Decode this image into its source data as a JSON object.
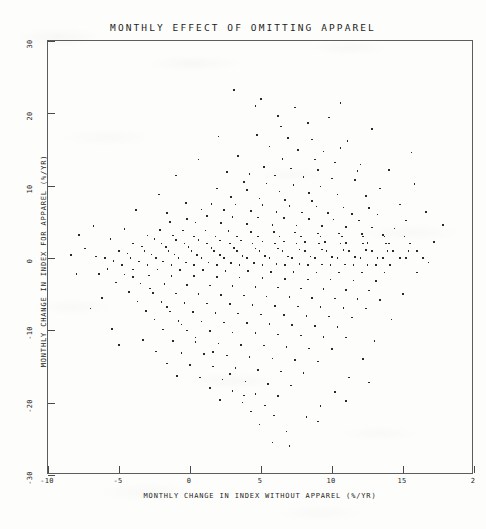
{
  "chart_data": {
    "type": "scatter",
    "title": "MONTHLY EFFECT OF OMITTING APPAREL",
    "xlabel": "MONTHLY CHANGE IN INDEX WITHOUT APPAREL (%/YR)",
    "ylabel": "MONTHLY CHANGE IN INDEX FOR APPAREL (%/YR)",
    "xlim": [
      -10,
      20
    ],
    "ylim": [
      -30,
      30
    ],
    "xticks": [
      -10,
      -5,
      0,
      5,
      10,
      15,
      20
    ],
    "xticklabels": [
      "-10",
      "-5",
      "0",
      "5",
      "10",
      "15",
      "2"
    ],
    "yticks": [
      30,
      20,
      10,
      0,
      -10,
      -20,
      -30
    ],
    "yticklabels": [
      "30",
      "20",
      "10",
      "0",
      "-10",
      "-20",
      "-30"
    ],
    "grid": false,
    "legend": null,
    "marker": "square-dot",
    "marker_color": "#2a2a2a",
    "n_points": 352,
    "points": [
      [
        3.1,
        23.2
      ],
      [
        5.0,
        22.0
      ],
      [
        10.6,
        21.4
      ],
      [
        6.2,
        19.6
      ],
      [
        8.3,
        18.7
      ],
      [
        4.7,
        17.0
      ],
      [
        6.9,
        16.6
      ],
      [
        11.1,
        16.2
      ],
      [
        15.6,
        14.6
      ],
      [
        5.6,
        15.4
      ],
      [
        7.6,
        14.9
      ],
      [
        9.4,
        14.7
      ],
      [
        3.4,
        14.1
      ],
      [
        6.5,
        13.7
      ],
      [
        8.8,
        13.6
      ],
      [
        10.2,
        13.2
      ],
      [
        12.0,
        12.9
      ],
      [
        5.2,
        12.6
      ],
      [
        7.1,
        12.4
      ],
      [
        9.0,
        12.2
      ],
      [
        2.6,
        11.9
      ],
      [
        4.2,
        11.6
      ],
      [
        6.0,
        11.4
      ],
      [
        8.0,
        11.2
      ],
      [
        10.0,
        11.0
      ],
      [
        11.6,
        10.8
      ],
      [
        3.8,
        10.5
      ],
      [
        5.4,
        10.3
      ],
      [
        7.3,
        10.1
      ],
      [
        9.2,
        9.9
      ],
      [
        1.9,
        9.6
      ],
      [
        4.0,
        9.4
      ],
      [
        6.3,
        9.2
      ],
      [
        8.4,
        9.0
      ],
      [
        10.4,
        8.8
      ],
      [
        12.4,
        8.6
      ],
      [
        2.9,
        8.4
      ],
      [
        4.9,
        8.2
      ],
      [
        6.7,
        8.0
      ],
      [
        8.6,
        7.9
      ],
      [
        -0.3,
        7.6
      ],
      [
        1.5,
        7.5
      ],
      [
        3.2,
        7.4
      ],
      [
        5.1,
        7.3
      ],
      [
        7.0,
        7.2
      ],
      [
        8.9,
        7.1
      ],
      [
        10.8,
        7.0
      ],
      [
        12.6,
        6.9
      ],
      [
        0.8,
        6.7
      ],
      [
        2.4,
        6.6
      ],
      [
        4.3,
        6.5
      ],
      [
        6.1,
        6.4
      ],
      [
        7.9,
        6.3
      ],
      [
        9.7,
        6.2
      ],
      [
        11.4,
        6.1
      ],
      [
        13.2,
        6.0
      ],
      [
        1.2,
        5.8
      ],
      [
        3.0,
        5.7
      ],
      [
        4.8,
        5.6
      ],
      [
        6.6,
        5.5
      ],
      [
        8.4,
        5.4
      ],
      [
        10.1,
        5.3
      ],
      [
        11.9,
        5.2
      ],
      [
        -1.4,
        5.0
      ],
      [
        0.4,
        4.9
      ],
      [
        2.2,
        4.8
      ],
      [
        4.0,
        4.7
      ],
      [
        5.8,
        4.6
      ],
      [
        7.5,
        4.5
      ],
      [
        9.3,
        4.4
      ],
      [
        11.0,
        4.3
      ],
      [
        12.8,
        4.2
      ],
      [
        14.4,
        4.1
      ],
      [
        -2.1,
        3.9
      ],
      [
        -0.5,
        3.8
      ],
      [
        1.1,
        3.8
      ],
      [
        2.7,
        3.7
      ],
      [
        4.3,
        3.6
      ],
      [
        5.9,
        3.6
      ],
      [
        7.4,
        3.5
      ],
      [
        9.0,
        3.4
      ],
      [
        10.5,
        3.4
      ],
      [
        12.1,
        3.3
      ],
      [
        13.6,
        3.2
      ],
      [
        -3.0,
        3.1
      ],
      [
        -1.2,
        3.1
      ],
      [
        0.3,
        3.0
      ],
      [
        1.8,
        3.0
      ],
      [
        3.3,
        3.0
      ],
      [
        4.8,
        3.0
      ],
      [
        6.3,
        3.0
      ],
      [
        7.8,
        3.0
      ],
      [
        9.2,
        3.0
      ],
      [
        10.7,
        3.0
      ],
      [
        12.2,
        3.0
      ],
      [
        13.7,
        3.0
      ],
      [
        15.1,
        3.0
      ],
      [
        -2.5,
        2.6
      ],
      [
        -1.0,
        2.5
      ],
      [
        0.6,
        2.5
      ],
      [
        2.1,
        2.4
      ],
      [
        3.6,
        2.4
      ],
      [
        5.1,
        2.3
      ],
      [
        6.6,
        2.3
      ],
      [
        8.1,
        2.2
      ],
      [
        9.5,
        2.2
      ],
      [
        11.0,
        2.1
      ],
      [
        12.5,
        2.1
      ],
      [
        14.0,
        2.0
      ],
      [
        15.5,
        2.0
      ],
      [
        -4.0,
        2.0
      ],
      [
        -2.0,
        2.0
      ],
      [
        -0.4,
        2.0
      ],
      [
        1.2,
        2.0
      ],
      [
        2.8,
        2.0
      ],
      [
        4.4,
        2.0
      ],
      [
        6.0,
        2.0
      ],
      [
        7.5,
        2.0
      ],
      [
        9.1,
        2.0
      ],
      [
        10.6,
        2.0
      ],
      [
        12.2,
        2.0
      ],
      [
        13.8,
        2.0
      ],
      [
        -3.4,
        1.6
      ],
      [
        -1.7,
        1.5
      ],
      [
        -0.1,
        1.5
      ],
      [
        1.5,
        1.4
      ],
      [
        3.1,
        1.4
      ],
      [
        4.6,
        1.3
      ],
      [
        6.2,
        1.3
      ],
      [
        7.7,
        1.2
      ],
      [
        9.3,
        1.2
      ],
      [
        10.8,
        1.1
      ],
      [
        12.4,
        1.1
      ],
      [
        13.9,
        1.0
      ],
      [
        15.4,
        1.0
      ],
      [
        -5.0,
        1.0
      ],
      [
        -3.2,
        1.0
      ],
      [
        -1.5,
        1.0
      ],
      [
        0.1,
        1.0
      ],
      [
        1.7,
        1.0
      ],
      [
        3.3,
        1.0
      ],
      [
        4.9,
        1.0
      ],
      [
        6.5,
        1.0
      ],
      [
        8.1,
        1.0
      ],
      [
        9.6,
        1.0
      ],
      [
        11.2,
        1.0
      ],
      [
        12.8,
        1.0
      ],
      [
        14.3,
        1.0
      ],
      [
        16.0,
        1.0
      ],
      [
        -4.4,
        0.6
      ],
      [
        -2.7,
        0.5
      ],
      [
        -1.1,
        0.5
      ],
      [
        0.5,
        0.4
      ],
      [
        2.1,
        0.4
      ],
      [
        3.7,
        0.3
      ],
      [
        5.3,
        0.3
      ],
      [
        6.9,
        0.2
      ],
      [
        8.5,
        0.2
      ],
      [
        10.0,
        0.1
      ],
      [
        11.6,
        0.1
      ],
      [
        13.2,
        0.0
      ],
      [
        14.8,
        0.0
      ],
      [
        16.4,
        0.0
      ],
      [
        -6.0,
        0.0
      ],
      [
        -4.2,
        0.0
      ],
      [
        -2.4,
        0.0
      ],
      [
        -0.8,
        0.0
      ],
      [
        0.8,
        0.0
      ],
      [
        2.4,
        0.0
      ],
      [
        4.0,
        0.0
      ],
      [
        5.6,
        0.0
      ],
      [
        7.2,
        0.0
      ],
      [
        8.8,
        0.0
      ],
      [
        10.4,
        0.0
      ],
      [
        12.0,
        0.0
      ],
      [
        13.6,
        0.0
      ],
      [
        15.2,
        0.0
      ],
      [
        -5.4,
        -0.4
      ],
      [
        -3.6,
        -0.5
      ],
      [
        -1.9,
        -0.5
      ],
      [
        -0.3,
        -0.6
      ],
      [
        1.3,
        -0.6
      ],
      [
        2.9,
        -0.7
      ],
      [
        4.5,
        -0.7
      ],
      [
        6.1,
        -0.8
      ],
      [
        7.7,
        -0.8
      ],
      [
        9.3,
        -0.9
      ],
      [
        10.9,
        -0.9
      ],
      [
        12.5,
        -1.0
      ],
      [
        14.1,
        -1.0
      ],
      [
        -4.8,
        -1.0
      ],
      [
        -3.0,
        -1.0
      ],
      [
        -1.3,
        -1.0
      ],
      [
        0.3,
        -1.0
      ],
      [
        1.9,
        -1.0
      ],
      [
        3.5,
        -1.0
      ],
      [
        5.1,
        -1.0
      ],
      [
        6.7,
        -1.0
      ],
      [
        8.3,
        -1.0
      ],
      [
        9.9,
        -1.0
      ],
      [
        11.5,
        -1.0
      ],
      [
        13.1,
        -1.0
      ],
      [
        -5.8,
        -1.5
      ],
      [
        -4.0,
        -1.6
      ],
      [
        -2.3,
        -1.6
      ],
      [
        -0.7,
        -1.7
      ],
      [
        0.9,
        -1.7
      ],
      [
        2.5,
        -1.8
      ],
      [
        4.1,
        -1.8
      ],
      [
        5.7,
        -1.9
      ],
      [
        7.3,
        -1.9
      ],
      [
        8.9,
        -2.0
      ],
      [
        10.5,
        -2.0
      ],
      [
        12.1,
        -2.0
      ],
      [
        13.7,
        -2.0
      ],
      [
        -6.4,
        -2.2
      ],
      [
        -4.6,
        -2.3
      ],
      [
        -2.9,
        -2.4
      ],
      [
        -1.3,
        -2.5
      ],
      [
        0.3,
        -2.5
      ],
      [
        1.9,
        -2.6
      ],
      [
        3.5,
        -2.7
      ],
      [
        5.1,
        -2.8
      ],
      [
        6.7,
        -2.9
      ],
      [
        8.3,
        -3.0
      ],
      [
        9.9,
        -3.0
      ],
      [
        11.5,
        -3.1
      ],
      [
        13.1,
        -3.2
      ],
      [
        -5.2,
        -3.4
      ],
      [
        -3.5,
        -3.5
      ],
      [
        -1.8,
        -3.6
      ],
      [
        -0.2,
        -3.7
      ],
      [
        1.4,
        -3.8
      ],
      [
        3.0,
        -3.9
      ],
      [
        4.6,
        -4.0
      ],
      [
        6.2,
        -4.1
      ],
      [
        7.8,
        -4.2
      ],
      [
        9.4,
        -4.3
      ],
      [
        11.0,
        -4.4
      ],
      [
        12.6,
        -4.5
      ],
      [
        -4.3,
        -4.7
      ],
      [
        -2.6,
        -4.8
      ],
      [
        -1.0,
        -4.9
      ],
      [
        0.6,
        -5.0
      ],
      [
        2.2,
        -5.1
      ],
      [
        3.8,
        -5.2
      ],
      [
        5.4,
        -5.3
      ],
      [
        7.0,
        -5.4
      ],
      [
        8.6,
        -5.5
      ],
      [
        10.2,
        -5.6
      ],
      [
        11.8,
        -5.7
      ],
      [
        13.4,
        -5.8
      ],
      [
        -3.7,
        -6.0
      ],
      [
        -2.0,
        -6.1
      ],
      [
        -0.4,
        -6.2
      ],
      [
        1.2,
        -6.3
      ],
      [
        2.8,
        -6.4
      ],
      [
        4.4,
        -6.5
      ],
      [
        6.0,
        -6.6
      ],
      [
        7.6,
        -6.7
      ],
      [
        9.2,
        -6.8
      ],
      [
        10.8,
        -6.9
      ],
      [
        12.4,
        -7.0
      ],
      [
        -3.1,
        -7.3
      ],
      [
        -1.4,
        -7.4
      ],
      [
        0.2,
        -7.5
      ],
      [
        1.8,
        -7.6
      ],
      [
        3.4,
        -7.7
      ],
      [
        5.0,
        -7.8
      ],
      [
        6.6,
        -7.9
      ],
      [
        8.2,
        -8.0
      ],
      [
        9.8,
        -8.1
      ],
      [
        11.4,
        -8.2
      ],
      [
        -2.5,
        -8.5
      ],
      [
        -0.8,
        -8.7
      ],
      [
        0.8,
        -8.8
      ],
      [
        2.4,
        -8.9
      ],
      [
        4.0,
        -9.0
      ],
      [
        5.6,
        -9.1
      ],
      [
        7.2,
        -9.3
      ],
      [
        8.8,
        -9.4
      ],
      [
        10.4,
        -9.5
      ],
      [
        -5.5,
        -9.8
      ],
      [
        -1.9,
        -9.9
      ],
      [
        -0.2,
        -10.0
      ],
      [
        1.4,
        -10.1
      ],
      [
        3.0,
        -10.3
      ],
      [
        4.6,
        -10.4
      ],
      [
        6.2,
        -10.6
      ],
      [
        7.8,
        -10.7
      ],
      [
        9.4,
        -10.9
      ],
      [
        11.0,
        -11.0
      ],
      [
        -3.3,
        -11.3
      ],
      [
        -1.2,
        -11.5
      ],
      [
        0.4,
        -11.6
      ],
      [
        2.0,
        -11.8
      ],
      [
        3.6,
        -12.0
      ],
      [
        5.2,
        -12.1
      ],
      [
        6.8,
        -12.3
      ],
      [
        8.4,
        -12.5
      ],
      [
        10.0,
        -12.6
      ],
      [
        -2.4,
        -12.9
      ],
      [
        -0.6,
        -13.1
      ],
      [
        1.0,
        -13.3
      ],
      [
        2.6,
        -13.5
      ],
      [
        4.2,
        -13.7
      ],
      [
        5.8,
        -13.9
      ],
      [
        7.4,
        -14.1
      ],
      [
        9.0,
        -14.3
      ],
      [
        -1.6,
        -14.6
      ],
      [
        0.0,
        -14.8
      ],
      [
        1.6,
        -15.0
      ],
      [
        3.2,
        -15.2
      ],
      [
        4.8,
        -15.5
      ],
      [
        6.4,
        -15.7
      ],
      [
        8.0,
        -15.9
      ],
      [
        -0.9,
        -16.3
      ],
      [
        0.7,
        -16.5
      ],
      [
        2.3,
        -16.8
      ],
      [
        3.9,
        -17.1
      ],
      [
        5.5,
        -17.4
      ],
      [
        7.1,
        -17.6
      ],
      [
        1.4,
        -18.0
      ],
      [
        3.0,
        -18.4
      ],
      [
        4.6,
        -18.8
      ],
      [
        6.2,
        -19.1
      ],
      [
        2.1,
        -19.6
      ],
      [
        3.7,
        -20.0
      ],
      [
        5.3,
        -20.4
      ],
      [
        4.3,
        -21.2
      ],
      [
        5.9,
        -21.8
      ],
      [
        4.9,
        -23.0
      ],
      [
        -6.8,
        4.4
      ],
      [
        -7.4,
        1.3
      ],
      [
        -8.0,
        -2.2
      ],
      [
        -6.2,
        -5.5
      ],
      [
        -7.0,
        -7.0
      ],
      [
        -5.0,
        -12.0
      ],
      [
        16.6,
        6.4
      ],
      [
        17.2,
        2.2
      ],
      [
        16.0,
        -2.0
      ],
      [
        15.0,
        -5.0
      ],
      [
        14.2,
        -8.5
      ],
      [
        13.0,
        -11.5
      ],
      [
        12.2,
        -14.0
      ],
      [
        11.2,
        -16.5
      ],
      [
        10.2,
        -18.5
      ],
      [
        9.2,
        -20.5
      ],
      [
        8.2,
        -22.0
      ],
      [
        6.8,
        -24.0
      ],
      [
        5.8,
        -25.5
      ],
      [
        13.4,
        9.6
      ],
      [
        14.8,
        7.4
      ],
      [
        15.8,
        10.2
      ],
      [
        12.8,
        17.8
      ],
      [
        9.8,
        19.4
      ],
      [
        7.4,
        20.8
      ],
      [
        2.0,
        16.8
      ],
      [
        0.6,
        13.6
      ],
      [
        -1.0,
        11.4
      ],
      [
        -2.2,
        8.8
      ],
      [
        -3.8,
        6.6
      ],
      [
        -1.6,
        6.2
      ],
      [
        -0.2,
        5.4
      ],
      [
        -4.6,
        4.0
      ],
      [
        -5.6,
        2.6
      ],
      [
        -6.6,
        0.2
      ],
      [
        -4.0,
        -2.6
      ],
      [
        -2.8,
        -4.2
      ],
      [
        -1.6,
        -6.8
      ],
      [
        -0.6,
        -9.2
      ],
      [
        0.4,
        -11.0
      ],
      [
        1.6,
        -13.0
      ],
      [
        2.8,
        -16.0
      ],
      [
        3.8,
        -19.0
      ],
      [
        11.8,
        12.0
      ],
      [
        10.6,
        15.2
      ],
      [
        8.6,
        16.4
      ],
      [
        6.4,
        18.2
      ],
      [
        4.6,
        21.0
      ],
      [
        14.0,
        12.2
      ],
      [
        15.2,
        5.2
      ],
      [
        16.8,
        -0.6
      ],
      [
        17.8,
        4.6
      ],
      [
        12.6,
        -17.2
      ],
      [
        11.0,
        -19.8
      ],
      [
        9.0,
        -22.6
      ],
      [
        7.0,
        -26.0
      ],
      [
        -7.8,
        3.2
      ],
      [
        -8.4,
        0.4
      ]
    ]
  }
}
